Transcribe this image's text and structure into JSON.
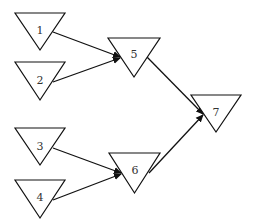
{
  "diagram": {
    "type": "tree",
    "colors": {
      "stroke": "#111111",
      "text": "#333333",
      "background": "#ffffff"
    },
    "nodes": [
      {
        "id": "1",
        "label": "1",
        "x1": 15,
        "x2": 65,
        "top": 13,
        "apex": 50,
        "tx": 40,
        "ty": 31
      },
      {
        "id": "2",
        "label": "2",
        "x1": 15,
        "x2": 65,
        "top": 62,
        "apex": 100,
        "tx": 40,
        "ty": 81
      },
      {
        "id": "3",
        "label": "3",
        "x1": 15,
        "x2": 65,
        "top": 128,
        "apex": 165,
        "tx": 40,
        "ty": 147
      },
      {
        "id": "4",
        "label": "4",
        "x1": 15,
        "x2": 65,
        "top": 180,
        "apex": 218,
        "tx": 40,
        "ty": 198
      },
      {
        "id": "5",
        "label": "5",
        "x1": 108,
        "x2": 160,
        "top": 38,
        "apex": 77,
        "tx": 134,
        "ty": 55
      },
      {
        "id": "6",
        "label": "6",
        "x1": 109,
        "x2": 160,
        "top": 153,
        "apex": 193,
        "tx": 135,
        "ty": 171
      },
      {
        "id": "7",
        "label": "7",
        "x1": 191,
        "x2": 241,
        "top": 95,
        "apex": 132,
        "tx": 216,
        "ty": 113
      }
    ],
    "edges": [
      {
        "from": "1",
        "to": "5",
        "x1": 53,
        "y1": 32,
        "x2": 120,
        "y2": 57
      },
      {
        "from": "2",
        "to": "5",
        "x1": 53,
        "y1": 82,
        "x2": 120,
        "y2": 58
      },
      {
        "from": "3",
        "to": "6",
        "x1": 53,
        "y1": 148,
        "x2": 121,
        "y2": 173
      },
      {
        "from": "4",
        "to": "6",
        "x1": 53,
        "y1": 200,
        "x2": 121,
        "y2": 174
      },
      {
        "from": "5",
        "to": "7",
        "x1": 147,
        "y1": 57,
        "x2": 203,
        "y2": 114
      },
      {
        "from": "6",
        "to": "7",
        "x1": 149,
        "y1": 173,
        "x2": 203,
        "y2": 115
      }
    ]
  }
}
